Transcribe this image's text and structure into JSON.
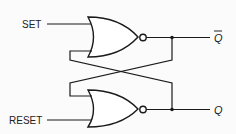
{
  "diagram": {
    "inputs": {
      "set": "SET",
      "reset": "RESET"
    },
    "outputs": {
      "q_bar": "Q",
      "q": "Q"
    },
    "gates": [
      {
        "id": "nor-top",
        "type": "NOR",
        "inputs": [
          "SET",
          "Q (feedback)"
        ],
        "output": "Q̄"
      },
      {
        "id": "nor-bottom",
        "type": "NOR",
        "inputs": [
          "Q̄ (feedback)",
          "RESET"
        ],
        "output": "Q"
      }
    ],
    "colors": {
      "line": "#1a1a1a",
      "background": "#fbfbfb"
    }
  }
}
